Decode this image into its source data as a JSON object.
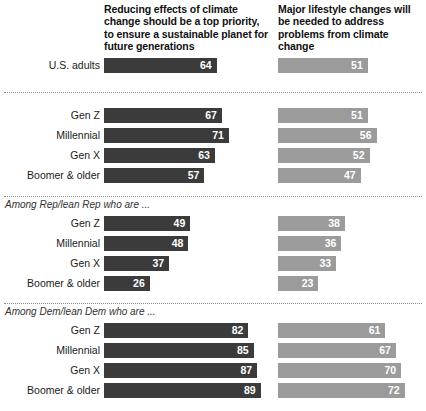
{
  "columns": [
    {
      "key": "priority",
      "title": "Reducing effects of climate change should be a top priority, to ensure a sustainable planet for future generations",
      "color": "#3b3b3b"
    },
    {
      "key": "lifestyle",
      "title": "Major lifestyle changes will be needed to address problems from climate change",
      "color": "#9b9b9b"
    }
  ],
  "sections": [
    {
      "label": "",
      "rows": [
        {
          "label": "U.S. adults",
          "priority": 64,
          "lifestyle": 51
        }
      ]
    },
    {
      "label": "",
      "rows": [
        {
          "label": "Gen Z",
          "priority": 67,
          "lifestyle": 51
        },
        {
          "label": "Millennial",
          "priority": 71,
          "lifestyle": 56
        },
        {
          "label": "Gen X",
          "priority": 63,
          "lifestyle": 52
        },
        {
          "label": "Boomer & older",
          "priority": 57,
          "lifestyle": 47
        }
      ]
    },
    {
      "label": "Among Rep/lean Rep who are ...",
      "rows": [
        {
          "label": "Gen Z",
          "priority": 49,
          "lifestyle": 38
        },
        {
          "label": "Millennial",
          "priority": 48,
          "lifestyle": 36
        },
        {
          "label": "Gen X",
          "priority": 37,
          "lifestyle": 33
        },
        {
          "label": "Boomer & older",
          "priority": 26,
          "lifestyle": 23
        }
      ]
    },
    {
      "label": "Among Dem/lean Dem who are ...",
      "rows": [
        {
          "label": "Gen Z",
          "priority": 82,
          "lifestyle": 61
        },
        {
          "label": "Millennial",
          "priority": 85,
          "lifestyle": 67
        },
        {
          "label": "Gen X",
          "priority": 87,
          "lifestyle": 70
        },
        {
          "label": "Boomer & older",
          "priority": 89,
          "lifestyle": 72
        }
      ]
    }
  ],
  "chart_data": {
    "type": "bar",
    "orientation": "horizontal",
    "title": "",
    "xlabel": "",
    "ylabel": "",
    "xlim": [
      0,
      100
    ],
    "grid": false,
    "legend": "column-headers",
    "categories": [
      "U.S. adults",
      "Gen Z",
      "Millennial",
      "Gen X",
      "Boomer & older",
      "Rep/lean Rep: Gen Z",
      "Rep/lean Rep: Millennial",
      "Rep/lean Rep: Gen X",
      "Rep/lean Rep: Boomer & older",
      "Dem/lean Dem: Gen Z",
      "Dem/lean Dem: Millennial",
      "Dem/lean Dem: Gen X",
      "Dem/lean Dem: Boomer & older"
    ],
    "series": [
      {
        "name": "Reducing effects of climate change should be a top priority, to ensure a sustainable planet for future generations",
        "color": "#3b3b3b",
        "values": [
          64,
          67,
          71,
          63,
          57,
          49,
          48,
          37,
          26,
          82,
          85,
          87,
          89
        ]
      },
      {
        "name": "Major lifestyle changes will be needed to address problems from climate change",
        "color": "#9b9b9b",
        "values": [
          51,
          51,
          56,
          52,
          47,
          38,
          36,
          33,
          23,
          61,
          67,
          70,
          72
        ]
      }
    ],
    "group_labels": [
      "",
      "",
      "Among Rep/lean Rep who are ...",
      "Among Dem/lean Dem who are ..."
    ]
  }
}
